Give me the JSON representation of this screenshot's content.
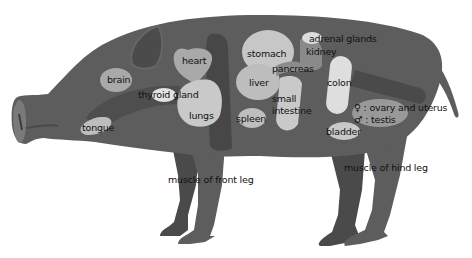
{
  "diagram": {
    "colors": {
      "body": "#5d5d5d",
      "body_dark": "#4a4a4a",
      "organ_light": "#c9c9c9",
      "organ_mid": "#a7a7a7",
      "organ_white": "#e4e4e4",
      "text": "#111111"
    },
    "labels": {
      "brain": "brain",
      "heart": "heart",
      "thyroid": "thyroid gland",
      "lungs": "lungs",
      "tongue": "tongue",
      "stomach": "stomach",
      "liver": "liver",
      "spleen": "spleen",
      "pancreas": "pancreas",
      "small_intestine_1": "small",
      "small_intestine_2": "intestine",
      "adrenal": "adrenal glands",
      "kidney": "kidney",
      "colon": "colon",
      "ovary": "♀ : ovary and uterus",
      "testis": "♂ : testis",
      "bladder": "bladder",
      "front_leg": "muscle of front leg",
      "hind_leg": "muscle of hind leg"
    }
  }
}
